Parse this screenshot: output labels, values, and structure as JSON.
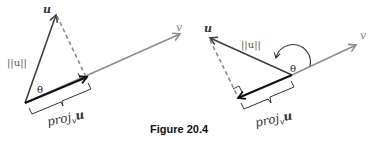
{
  "caption": "Figure 20.4",
  "colors": {
    "vector_v": "#8c8c8c",
    "vector_u": "#404040",
    "projection": "#111111",
    "dashed": "#8a8a8a",
    "text": "#333333"
  },
  "figures": [
    {
      "id": "acute",
      "labels": {
        "u": "u",
        "v": "v",
        "norm_u": "||u||",
        "theta": "θ",
        "proj_base": "proj",
        "proj_sub": "v",
        "proj_vec": "u"
      }
    },
    {
      "id": "obtuse",
      "labels": {
        "u": "u",
        "v": "v",
        "norm_u": "||u||",
        "theta": "θ",
        "proj_base": "proj",
        "proj_sub": "v",
        "proj_vec": "u"
      }
    }
  ]
}
